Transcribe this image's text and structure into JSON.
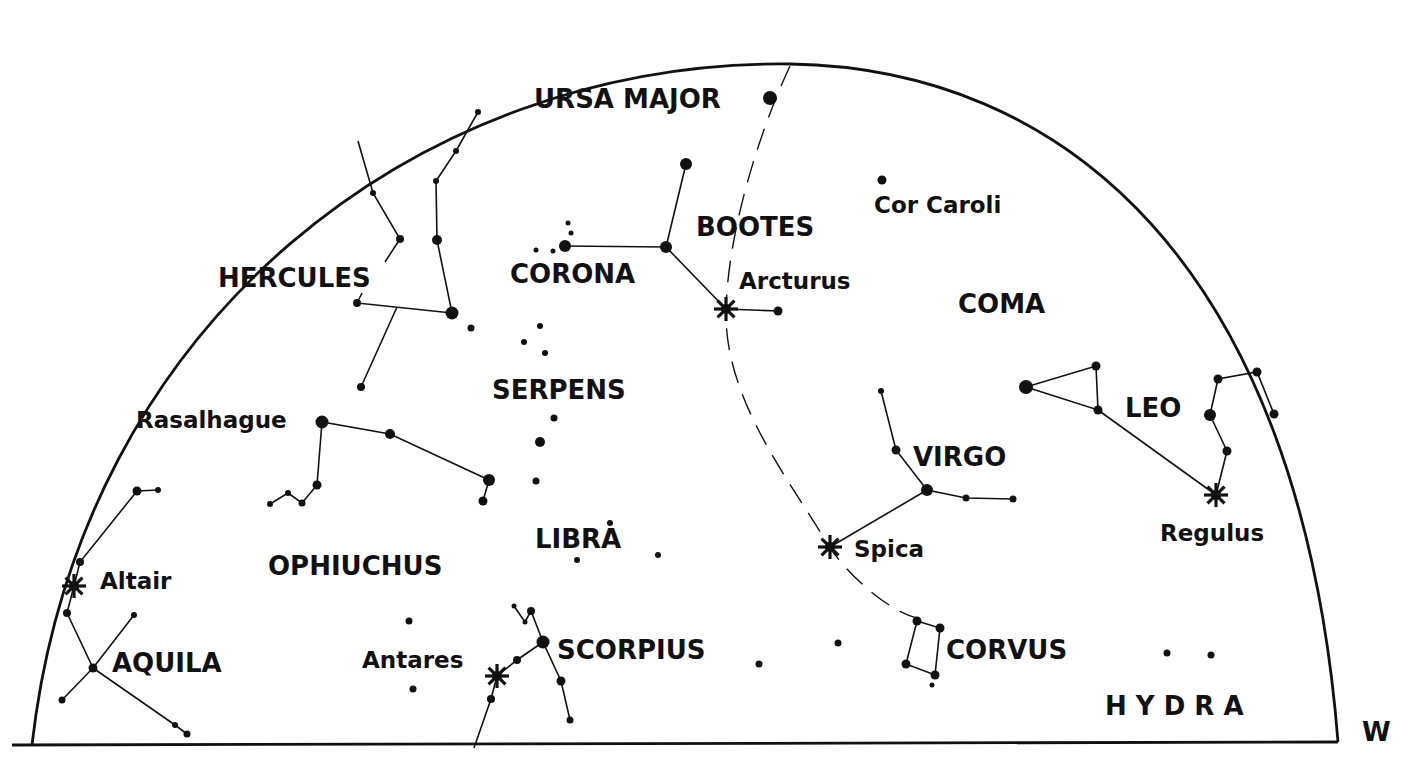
{
  "chart": {
    "title": "",
    "direction_label": "W",
    "frame": {
      "horizon": {
        "x1": 12,
        "y1": 745,
        "x2": 1338,
        "y2": 742
      },
      "arc_path": "M 32 745 C 80 320, 420 60, 790 64 C 1060 68, 1300 260, 1338 742"
    },
    "ecliptic_path": "M 790 66 C 760 130, 728 230, 726 310 C 724 400, 790 480, 830 548 C 860 590, 900 615, 918 618"
  },
  "constellations": [
    {
      "name": "URSA MAJOR",
      "x": 534,
      "y": 108
    },
    {
      "name": "BOOTES",
      "x": 696,
      "y": 236
    },
    {
      "name": "HERCULES",
      "x": 218,
      "y": 287
    },
    {
      "name": "CORONA",
      "x": 510,
      "y": 283
    },
    {
      "name": "COMA",
      "x": 958,
      "y": 313
    },
    {
      "name": "SERPENS",
      "x": 492,
      "y": 399
    },
    {
      "name": "LEO",
      "x": 1125,
      "y": 417
    },
    {
      "name": "VIRGO",
      "x": 913,
      "y": 466
    },
    {
      "name": "LIBRA",
      "x": 535,
      "y": 548
    },
    {
      "name": "OPHIUCHUS",
      "x": 268,
      "y": 575
    },
    {
      "name": "AQUILA",
      "x": 112,
      "y": 672
    },
    {
      "name": "SCORPIUS",
      "x": 557,
      "y": 659
    },
    {
      "name": "CORVUS",
      "x": 946,
      "y": 659
    },
    {
      "name": "H Y D R A",
      "x": 1105,
      "y": 715
    }
  ],
  "star_names": [
    {
      "name": "Cor Caroli",
      "x": 874,
      "y": 213
    },
    {
      "name": "Arcturus",
      "x": 739,
      "y": 289
    },
    {
      "name": "Rasalhague",
      "x": 136,
      "y": 428
    },
    {
      "name": "Regulus",
      "x": 1160,
      "y": 541
    },
    {
      "name": "Spica",
      "x": 854,
      "y": 557
    },
    {
      "name": "Altair",
      "x": 100,
      "y": 589
    },
    {
      "name": "Antares",
      "x": 362,
      "y": 668
    }
  ],
  "bright_stars": [
    {
      "name": "Arcturus",
      "x": 726,
      "y": 309
    },
    {
      "name": "Regulus",
      "x": 1216,
      "y": 495
    },
    {
      "name": "Spica",
      "x": 830,
      "y": 547
    },
    {
      "name": "Altair",
      "x": 74,
      "y": 586
    },
    {
      "name": "Antares",
      "x": 497,
      "y": 676
    }
  ],
  "stars": [
    {
      "x": 770,
      "y": 98,
      "r": 7
    },
    {
      "x": 686,
      "y": 164,
      "r": 6
    },
    {
      "x": 666,
      "y": 247,
      "r": 6
    },
    {
      "x": 565,
      "y": 246,
      "r": 6
    },
    {
      "x": 568,
      "y": 223,
      "r": 2.5
    },
    {
      "x": 571,
      "y": 233,
      "r": 2.5
    },
    {
      "x": 553,
      "y": 251,
      "r": 2.5
    },
    {
      "x": 536,
      "y": 250,
      "r": 2.5
    },
    {
      "x": 778,
      "y": 311,
      "r": 4.5
    },
    {
      "x": 882,
      "y": 180,
      "r": 4.5
    },
    {
      "x": 478,
      "y": 112,
      "r": 3
    },
    {
      "x": 456,
      "y": 151,
      "r": 3
    },
    {
      "x": 436,
      "y": 181,
      "r": 3
    },
    {
      "x": 437,
      "y": 240,
      "r": 5
    },
    {
      "x": 452,
      "y": 313,
      "r": 6.5
    },
    {
      "x": 373,
      "y": 193,
      "r": 3
    },
    {
      "x": 400,
      "y": 239,
      "r": 4
    },
    {
      "x": 357,
      "y": 303,
      "r": 4
    },
    {
      "x": 361,
      "y": 387,
      "r": 4
    },
    {
      "x": 471,
      "y": 328,
      "r": 3.5
    },
    {
      "x": 540,
      "y": 326,
      "r": 3
    },
    {
      "x": 524,
      "y": 342,
      "r": 3
    },
    {
      "x": 545,
      "y": 353,
      "r": 3
    },
    {
      "x": 554,
      "y": 418,
      "r": 3.5
    },
    {
      "x": 540,
      "y": 442,
      "r": 5
    },
    {
      "x": 536,
      "y": 481,
      "r": 3.5
    },
    {
      "x": 322,
      "y": 422,
      "r": 6.5
    },
    {
      "x": 390,
      "y": 434,
      "r": 5
    },
    {
      "x": 489,
      "y": 480,
      "r": 6
    },
    {
      "x": 483,
      "y": 501,
      "r": 4.5
    },
    {
      "x": 317,
      "y": 485,
      "r": 4.5
    },
    {
      "x": 302,
      "y": 503,
      "r": 3.5
    },
    {
      "x": 288,
      "y": 493,
      "r": 3
    },
    {
      "x": 270,
      "y": 504,
      "r": 3
    },
    {
      "x": 610,
      "y": 523,
      "r": 3
    },
    {
      "x": 577,
      "y": 560,
      "r": 3
    },
    {
      "x": 658,
      "y": 555,
      "r": 3
    },
    {
      "x": 137,
      "y": 491,
      "r": 4.5
    },
    {
      "x": 158,
      "y": 490,
      "r": 3
    },
    {
      "x": 80,
      "y": 562,
      "r": 4
    },
    {
      "x": 67,
      "y": 613,
      "r": 4
    },
    {
      "x": 134,
      "y": 615,
      "r": 3
    },
    {
      "x": 93,
      "y": 668,
      "r": 4.5
    },
    {
      "x": 62,
      "y": 700,
      "r": 3.5
    },
    {
      "x": 175,
      "y": 725,
      "r": 3
    },
    {
      "x": 187,
      "y": 734,
      "r": 3.5
    },
    {
      "x": 409,
      "y": 621,
      "r": 3.5
    },
    {
      "x": 413,
      "y": 689,
      "r": 3.5
    },
    {
      "x": 514,
      "y": 606,
      "r": 2.5
    },
    {
      "x": 525,
      "y": 622,
      "r": 2.5
    },
    {
      "x": 531,
      "y": 611,
      "r": 4
    },
    {
      "x": 543,
      "y": 642,
      "r": 6.5
    },
    {
      "x": 517,
      "y": 660,
      "r": 4
    },
    {
      "x": 561,
      "y": 681,
      "r": 4.5
    },
    {
      "x": 570,
      "y": 720,
      "r": 3.5
    },
    {
      "x": 491,
      "y": 699,
      "r": 4
    },
    {
      "x": 759,
      "y": 664,
      "r": 3.5
    },
    {
      "x": 838,
      "y": 643,
      "r": 3.5
    },
    {
      "x": 881,
      "y": 391,
      "r": 3
    },
    {
      "x": 896,
      "y": 450,
      "r": 4.5
    },
    {
      "x": 927,
      "y": 490,
      "r": 6
    },
    {
      "x": 966,
      "y": 498,
      "r": 3.5
    },
    {
      "x": 1013,
      "y": 499,
      "r": 3.5
    },
    {
      "x": 917,
      "y": 621,
      "r": 4.5
    },
    {
      "x": 940,
      "y": 628,
      "r": 4.5
    },
    {
      "x": 906,
      "y": 664,
      "r": 4.5
    },
    {
      "x": 935,
      "y": 675,
      "r": 4.5
    },
    {
      "x": 932,
      "y": 685,
      "r": 2.5
    },
    {
      "x": 1026,
      "y": 387,
      "r": 7
    },
    {
      "x": 1096,
      "y": 366,
      "r": 4.5
    },
    {
      "x": 1098,
      "y": 410,
      "r": 4.5
    },
    {
      "x": 1218,
      "y": 379,
      "r": 4.5
    },
    {
      "x": 1257,
      "y": 372,
      "r": 4.5
    },
    {
      "x": 1274,
      "y": 414,
      "r": 4.5
    },
    {
      "x": 1210,
      "y": 415,
      "r": 6
    },
    {
      "x": 1227,
      "y": 451,
      "r": 4.5
    },
    {
      "x": 1167,
      "y": 653,
      "r": 3.5
    },
    {
      "x": 1211,
      "y": 655,
      "r": 3.5
    }
  ],
  "lines": [
    [
      [
        686,
        164
      ],
      [
        666,
        247
      ]
    ],
    [
      [
        565,
        246
      ],
      [
        666,
        247
      ]
    ],
    [
      [
        666,
        247
      ],
      [
        726,
        309
      ]
    ],
    [
      [
        726,
        309
      ],
      [
        778,
        311
      ]
    ],
    [
      [
        478,
        112
      ],
      [
        456,
        151
      ],
      [
        436,
        181
      ],
      [
        437,
        240
      ],
      [
        452,
        313
      ]
    ],
    [
      [
        358,
        141
      ],
      [
        373,
        193
      ],
      [
        400,
        239
      ],
      [
        385,
        262
      ]
    ],
    [
      [
        357,
        303
      ],
      [
        452,
        313
      ]
    ],
    [
      [
        397,
        307
      ],
      [
        361,
        387
      ]
    ],
    [
      [
        357,
        303
      ],
      [
        362,
        293
      ]
    ],
    [
      [
        270,
        504
      ],
      [
        288,
        493
      ],
      [
        302,
        503
      ],
      [
        317,
        485
      ],
      [
        322,
        422
      ],
      [
        390,
        434
      ],
      [
        489,
        480
      ],
      [
        483,
        501
      ]
    ],
    [
      [
        158,
        490
      ],
      [
        137,
        491
      ],
      [
        80,
        562
      ],
      [
        74,
        586
      ],
      [
        67,
        613
      ],
      [
        93,
        668
      ],
      [
        134,
        615
      ]
    ],
    [
      [
        93,
        668
      ],
      [
        62,
        700
      ]
    ],
    [
      [
        93,
        668
      ],
      [
        175,
        725
      ],
      [
        187,
        734
      ]
    ],
    [
      [
        514,
        606
      ],
      [
        525,
        622
      ],
      [
        531,
        611
      ],
      [
        543,
        642
      ],
      [
        561,
        681
      ],
      [
        570,
        720
      ]
    ],
    [
      [
        543,
        642
      ],
      [
        517,
        660
      ],
      [
        497,
        676
      ],
      [
        491,
        699
      ],
      [
        474,
        748
      ]
    ],
    [
      [
        881,
        391
      ],
      [
        896,
        450
      ],
      [
        927,
        490
      ],
      [
        966,
        498
      ],
      [
        1013,
        499
      ]
    ],
    [
      [
        927,
        490
      ],
      [
        830,
        547
      ]
    ],
    [
      [
        917,
        621
      ],
      [
        940,
        628
      ],
      [
        935,
        675
      ],
      [
        906,
        664
      ],
      [
        917,
        621
      ]
    ],
    [
      [
        1026,
        387
      ],
      [
        1096,
        366
      ],
      [
        1098,
        410
      ],
      [
        1026,
        387
      ]
    ],
    [
      [
        1098,
        410
      ],
      [
        1216,
        495
      ]
    ],
    [
      [
        1216,
        495
      ],
      [
        1227,
        451
      ],
      [
        1210,
        415
      ],
      [
        1218,
        379
      ],
      [
        1257,
        372
      ],
      [
        1274,
        414
      ]
    ]
  ]
}
